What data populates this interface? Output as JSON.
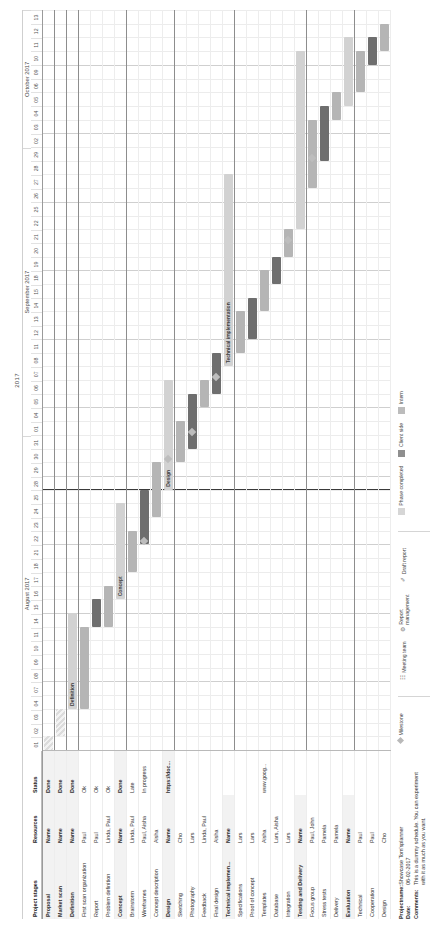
{
  "chart_data": {
    "type": "table",
    "year": "2017",
    "months": [
      {
        "name": "August 2017",
        "days": [
          "01",
          "02",
          "03",
          "04",
          "07",
          "08",
          "09",
          "10",
          "11",
          "14",
          "15",
          "16",
          "17",
          "18",
          "21",
          "22",
          "23",
          "24",
          "25",
          "28",
          "29",
          "30",
          "31"
        ]
      },
      {
        "name": "September 2017",
        "days": [
          "01",
          "04",
          "05",
          "06",
          "07",
          "08",
          "11",
          "12",
          "13",
          "14",
          "15",
          "18",
          "19",
          "20",
          "21",
          "22",
          "25",
          "26",
          "27",
          "28",
          "29"
        ]
      },
      {
        "name": "October 2017",
        "days": [
          "02",
          "03",
          "04",
          "05",
          "06",
          "09",
          "10",
          "11",
          "12",
          "13"
        ]
      }
    ],
    "columns": [
      "Project stages",
      "Resources",
      "Status"
    ],
    "rows": [
      {
        "stage": "Proposal",
        "resources": "Name",
        "status": "Done",
        "group": true,
        "bar": {
          "start": 0,
          "span": 1,
          "tone": "hatch"
        }
      },
      {
        "stage": "Market scan",
        "resources": "Name",
        "status": "Done",
        "group": true,
        "bar": {
          "start": 1,
          "span": 2,
          "tone": "hatch"
        }
      },
      {
        "stage": "Definition",
        "resources": "Name",
        "status": "Done",
        "group": true,
        "bar": {
          "start": 3,
          "span": 7,
          "tone": "light",
          "label": "Definition"
        }
      },
      {
        "stage": "First scan organization",
        "resources": "Paul",
        "status": "Ok",
        "group": false,
        "bar": {
          "start": 3,
          "span": 6,
          "tone": "mid"
        }
      },
      {
        "stage": "Report",
        "resources": "Paul",
        "status": "Ok",
        "group": false,
        "bar": {
          "start": 9,
          "span": 2,
          "tone": "dark"
        }
      },
      {
        "stage": "Problem definition",
        "resources": "Linda, Paul",
        "status": "Ok",
        "group": false,
        "bar": {
          "start": 9,
          "span": 3,
          "tone": "mid"
        }
      },
      {
        "stage": "Concept",
        "resources": "Name",
        "status": "Done",
        "group": true,
        "bar": {
          "start": 11,
          "span": 7,
          "tone": "light",
          "label": "Concept"
        }
      },
      {
        "stage": "Brainstorm",
        "resources": "Linda, Paul",
        "status": "Late",
        "group": false,
        "bar": {
          "start": 13,
          "span": 3,
          "tone": "mid"
        }
      },
      {
        "stage": "Wireframes",
        "resources": "Paul, Aisha",
        "status": "In progress",
        "group": false,
        "bar": {
          "start": 15,
          "span": 4,
          "tone": "dark"
        }
      },
      {
        "stage": "Concept description",
        "resources": "Aisha",
        "status": "",
        "group": false,
        "bar": {
          "start": 17,
          "span": 4,
          "tone": "mid"
        }
      },
      {
        "stage": "Design",
        "resources": "Name",
        "status": "https://doc...",
        "group": true,
        "bar": {
          "start": 19,
          "span": 8,
          "tone": "light",
          "label": "Design"
        }
      },
      {
        "stage": "Sketching",
        "resources": "Cho",
        "status": "",
        "group": false,
        "bar": {
          "start": 21,
          "span": 3,
          "tone": "mid"
        }
      },
      {
        "stage": "Photography",
        "resources": "Lars",
        "status": "",
        "group": false,
        "bar": {
          "start": 22,
          "span": 4,
          "tone": "dark"
        }
      },
      {
        "stage": "Feedback",
        "resources": "Linda, Paul",
        "status": "",
        "group": false,
        "bar": {
          "start": 25,
          "span": 2,
          "tone": "mid"
        }
      },
      {
        "stage": "Final design",
        "resources": "Aisha",
        "status": "",
        "group": false,
        "bar": {
          "start": 26,
          "span": 3,
          "tone": "dark"
        }
      },
      {
        "stage": "Technical implemen...",
        "resources": "Name",
        "status": "",
        "group": true,
        "bar": {
          "start": 28,
          "span": 14,
          "tone": "light",
          "label": "Technical implementation"
        }
      },
      {
        "stage": "Specifications",
        "resources": "Lars",
        "status": "",
        "group": false,
        "bar": {
          "start": 29,
          "span": 3,
          "tone": "mid"
        }
      },
      {
        "stage": "Proof of concept",
        "resources": "Lars",
        "status": "",
        "group": false,
        "bar": {
          "start": 30,
          "span": 3,
          "tone": "dark"
        }
      },
      {
        "stage": "Templates",
        "resources": "Aisha",
        "status": "www.goog...",
        "group": false,
        "bar": {
          "start": 32,
          "span": 3,
          "tone": "mid"
        }
      },
      {
        "stage": "Database",
        "resources": "Lars, Aisha",
        "status": "",
        "group": false,
        "bar": {
          "start": 34,
          "span": 2,
          "tone": "dark"
        }
      },
      {
        "stage": "Integration",
        "resources": "Lars",
        "status": "",
        "group": false,
        "bar": {
          "start": 36,
          "span": 2,
          "tone": "mid"
        }
      },
      {
        "stage": "Testing and Delivery",
        "resources": "Name",
        "status": "",
        "group": true,
        "bar": {
          "start": 38,
          "span": 13,
          "tone": "light",
          "label": ""
        }
      },
      {
        "stage": "Focus group",
        "resources": "Paul, John",
        "status": "",
        "group": false,
        "bar": {
          "start": 41,
          "span": 5,
          "tone": "mid"
        }
      },
      {
        "stage": "Stress tests",
        "resources": "Pamela",
        "status": "",
        "group": false,
        "bar": {
          "start": 43,
          "span": 4,
          "tone": "dark"
        }
      },
      {
        "stage": "Delivery",
        "resources": "Pamela",
        "status": "",
        "group": false,
        "bar": {
          "start": 46,
          "span": 2,
          "tone": "mid"
        }
      },
      {
        "stage": "Evaluation",
        "resources": "Name",
        "status": "",
        "group": true,
        "bar": {
          "start": 47,
          "span": 5,
          "tone": "light"
        }
      },
      {
        "stage": "Technical",
        "resources": "Paul",
        "status": "",
        "group": false,
        "bar": {
          "start": 48,
          "span": 3,
          "tone": "mid"
        }
      },
      {
        "stage": "Cooperation",
        "resources": "Paul",
        "status": "",
        "group": false,
        "bar": {
          "start": 50,
          "span": 2,
          "tone": "dark"
        }
      },
      {
        "stage": "Design",
        "resources": "Cho",
        "status": "",
        "group": false,
        "bar": {
          "start": 51,
          "span": 2,
          "tone": "mid"
        }
      }
    ],
    "today_index": 19,
    "milestones": [
      {
        "row": 8,
        "col": 15
      },
      {
        "row": 10,
        "col": 21
      },
      {
        "row": 12,
        "col": 23
      },
      {
        "row": 14,
        "col": 27
      },
      {
        "row": 20,
        "col": 37
      },
      {
        "row": 22,
        "col": 43
      }
    ]
  },
  "footer": {
    "projectname_label": "Projectname:",
    "projectname_value": "Showcase Tom'splanner",
    "date_label": "Date:",
    "date_value": "06-02-2017",
    "comments_label": "Comments:",
    "comments_value": "This is a dummy schedule. You can experiment with it as much as you want."
  },
  "legend": {
    "milestone": "Milestone",
    "marks": [
      "Meeting team",
      "Report management",
      "Draft report"
    ],
    "swatches": [
      "Phase completed",
      "Client side",
      "Intern"
    ]
  }
}
